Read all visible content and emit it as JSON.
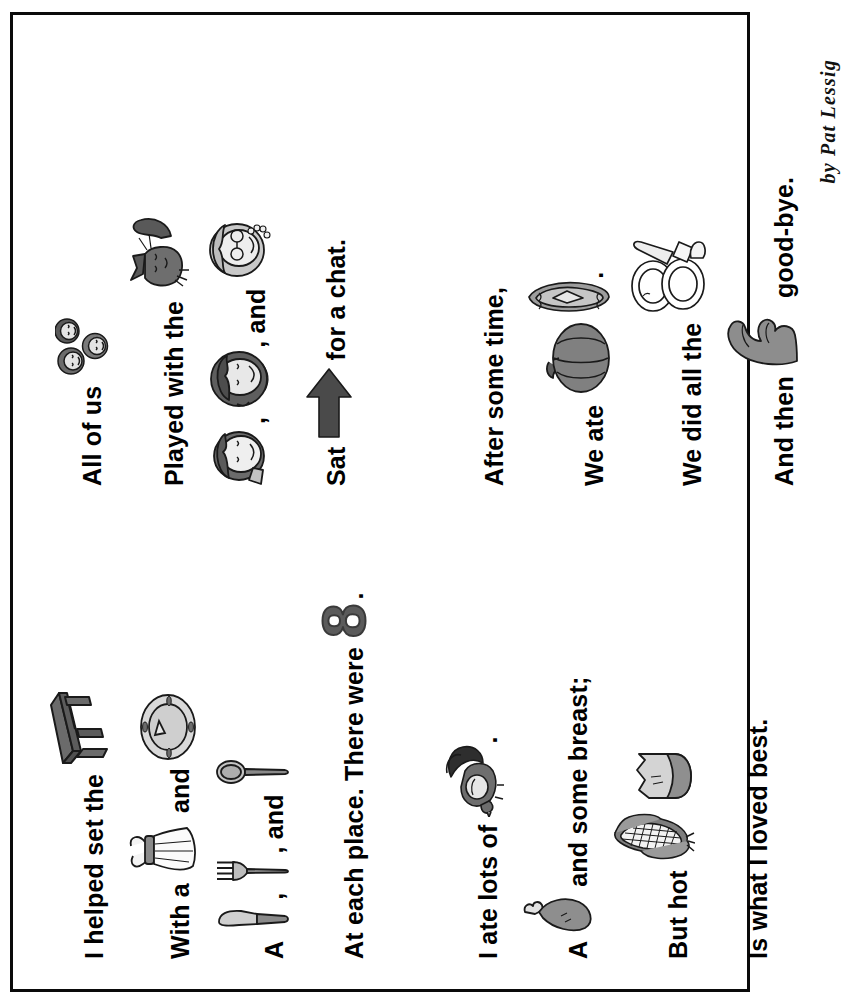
{
  "document": {
    "title": "Thanksgiving Rebus Poem",
    "byline": "by Pat Lessig",
    "orientation": "rotated-90",
    "border_color": "#0a0a0a",
    "page_color": "#ffffff"
  },
  "palette": {
    "ink": "#000000",
    "gray_dark": "#4f4f4f",
    "gray_mid": "#8a8a8a",
    "gray_light": "#c9c9c9",
    "gray_pale": "#e2e2e2",
    "outline": "#1a1a1a"
  },
  "columns": [
    {
      "name": "left-column",
      "stanzas": [
        {
          "name": "stanza-one",
          "lines": [
            {
              "id": "l1",
              "parts": [
                {
                  "kind": "text",
                  "value": "I helped set the"
                },
                {
                  "kind": "icon",
                  "name": "table-icon",
                  "label": "table"
                }
              ]
            },
            {
              "id": "l2",
              "parts": [
                {
                  "kind": "text",
                  "value": "With a"
                },
                {
                  "kind": "icon",
                  "name": "napkin-icon",
                  "label": "napkin"
                },
                {
                  "kind": "text",
                  "value": "and"
                },
                {
                  "kind": "icon",
                  "name": "plate-icon",
                  "label": "plate"
                }
              ]
            },
            {
              "id": "l3",
              "parts": [
                {
                  "kind": "text",
                  "value": "A"
                },
                {
                  "kind": "icon",
                  "name": "knife-icon",
                  "label": "knife"
                },
                {
                  "kind": "text",
                  "value": ","
                },
                {
                  "kind": "icon",
                  "name": "fork-icon",
                  "label": "fork"
                },
                {
                  "kind": "text",
                  "value": ", and"
                },
                {
                  "kind": "icon",
                  "name": "spoon-icon",
                  "label": "spoon"
                }
              ]
            },
            {
              "id": "l4",
              "parts": [
                {
                  "kind": "text",
                  "value": "At each place. There were"
                },
                {
                  "kind": "number",
                  "name": "number-eight",
                  "value": "8"
                },
                {
                  "kind": "text",
                  "value": "."
                }
              ]
            }
          ]
        },
        {
          "name": "stanza-two",
          "lines": [
            {
              "id": "l5",
              "parts": [
                {
                  "kind": "text",
                  "value": "I ate lots of"
                },
                {
                  "kind": "icon",
                  "name": "turkey-icon",
                  "label": "turkey"
                },
                {
                  "kind": "text",
                  "value": "."
                }
              ]
            },
            {
              "id": "l6",
              "parts": [
                {
                  "kind": "text",
                  "value": "A"
                },
                {
                  "kind": "icon",
                  "name": "drumstick-icon",
                  "label": "drumstick"
                },
                {
                  "kind": "text",
                  "value": "and some breast;"
                }
              ]
            },
            {
              "id": "l7",
              "parts": [
                {
                  "kind": "text",
                  "value": "But hot"
                },
                {
                  "kind": "icon",
                  "name": "corn-icon",
                  "label": "corn on the cob"
                },
                {
                  "kind": "icon",
                  "name": "butter-icon",
                  "label": "butter"
                }
              ]
            },
            {
              "id": "l8",
              "parts": [
                {
                  "kind": "text",
                  "value": "Is what I loved best."
                }
              ]
            }
          ]
        }
      ]
    },
    {
      "name": "right-column",
      "stanzas": [
        {
          "name": "stanza-three",
          "lines": [
            {
              "id": "r1",
              "parts": [
                {
                  "kind": "text",
                  "value": "All of us"
                },
                {
                  "kind": "icon",
                  "name": "children-faces-icon",
                  "label": "children"
                }
              ]
            },
            {
              "id": "r2",
              "parts": [
                {
                  "kind": "text",
                  "value": "Played with the"
                },
                {
                  "kind": "icon",
                  "name": "cat-icon",
                  "label": "cat"
                }
              ]
            },
            {
              "id": "r3",
              "parts": [
                {
                  "kind": "icon",
                  "name": "boy-face-icon",
                  "label": "boy"
                },
                {
                  "kind": "text",
                  "value": ","
                },
                {
                  "kind": "icon",
                  "name": "girl-face-icon",
                  "label": "girl"
                },
                {
                  "kind": "text",
                  "value": ", and"
                },
                {
                  "kind": "icon",
                  "name": "grandma-face-icon",
                  "label": "grandma"
                }
              ]
            },
            {
              "id": "r4",
              "parts": [
                {
                  "kind": "text",
                  "value": "Sat"
                },
                {
                  "kind": "icon",
                  "name": "arrow-right-icon",
                  "label": "arrow"
                },
                {
                  "kind": "text",
                  "value": "for a chat."
                }
              ]
            }
          ]
        },
        {
          "name": "stanza-four",
          "lines": [
            {
              "id": "r5",
              "parts": [
                {
                  "kind": "text",
                  "value": "After some time,"
                }
              ]
            },
            {
              "id": "r6",
              "parts": [
                {
                  "kind": "text",
                  "value": "We ate"
                },
                {
                  "kind": "icon",
                  "name": "pumpkin-icon",
                  "label": "pumpkin"
                },
                {
                  "kind": "icon",
                  "name": "pie-icon",
                  "label": "pie"
                },
                {
                  "kind": "text",
                  "value": "."
                }
              ]
            },
            {
              "id": "r7",
              "parts": [
                {
                  "kind": "text",
                  "value": "We did all the"
                },
                {
                  "kind": "icon",
                  "name": "dishes-icon",
                  "label": "dishes"
                }
              ]
            },
            {
              "id": "r8",
              "parts": [
                {
                  "kind": "text",
                  "value": "And then"
                },
                {
                  "kind": "icon",
                  "name": "waving-hand-icon",
                  "label": "wave"
                },
                {
                  "kind": "text",
                  "value": "good-bye."
                }
              ]
            }
          ]
        }
      ]
    }
  ]
}
